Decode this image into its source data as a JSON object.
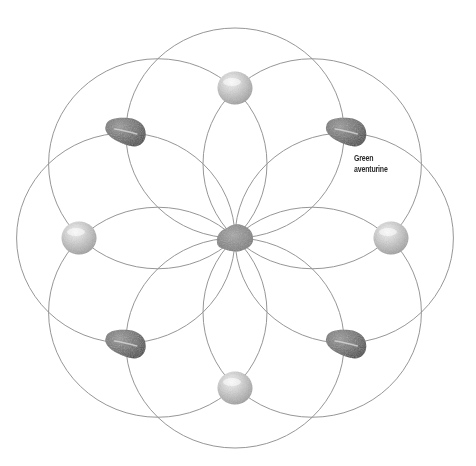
{
  "diagram": {
    "ring_count": 8,
    "colors": {
      "ring_stroke": "#8a8a8a",
      "pearl_light": "#f2f2f2",
      "pearl_mid": "#c9c9c9",
      "pearl_dark": "#9a9a9a",
      "tumbled_light": "#8e8e8e",
      "tumbled_dark": "#4a4a4a",
      "center_stone": "#8c8c8c",
      "label_text": "#2a2a2a"
    },
    "stones": [
      {
        "id": "center",
        "kind": "rough",
        "angle_deg": null
      },
      {
        "id": "top",
        "kind": "pearl",
        "angle_deg": 270
      },
      {
        "id": "top-right",
        "kind": "tumbled",
        "angle_deg": 315
      },
      {
        "id": "right",
        "kind": "pearl",
        "angle_deg": 0
      },
      {
        "id": "bottom-right",
        "kind": "tumbled",
        "angle_deg": 45
      },
      {
        "id": "bottom",
        "kind": "pearl",
        "angle_deg": 90
      },
      {
        "id": "bottom-left",
        "kind": "tumbled",
        "angle_deg": 135
      },
      {
        "id": "left",
        "kind": "pearl",
        "angle_deg": 180
      },
      {
        "id": "top-left",
        "kind": "tumbled",
        "angle_deg": 225
      }
    ],
    "labels": {
      "green_aventurine_line1": "Green",
      "green_aventurine_line2": "aventurine"
    }
  }
}
